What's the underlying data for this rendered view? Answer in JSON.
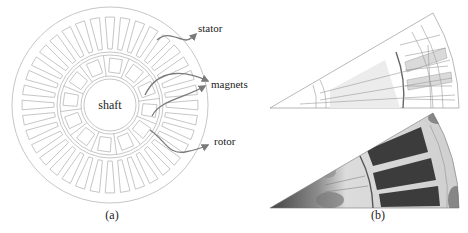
{
  "figure": {
    "panel_a": {
      "caption": "(a)",
      "center_label": "shaft",
      "callouts": [
        {
          "id": "stator",
          "label": "stator"
        },
        {
          "id": "magnets",
          "label": "magnets"
        },
        {
          "id": "rotor",
          "label": "rotor"
        }
      ]
    },
    "panel_b": {
      "caption": "(b)",
      "views": [
        "mesh",
        "field-solution"
      ]
    },
    "colors": {
      "line": "#b8b8b8",
      "arrow": "#7a7a7a",
      "text": "#222222",
      "field_dark": "#3a3a3a",
      "field_light": "#d8d8d8"
    }
  }
}
